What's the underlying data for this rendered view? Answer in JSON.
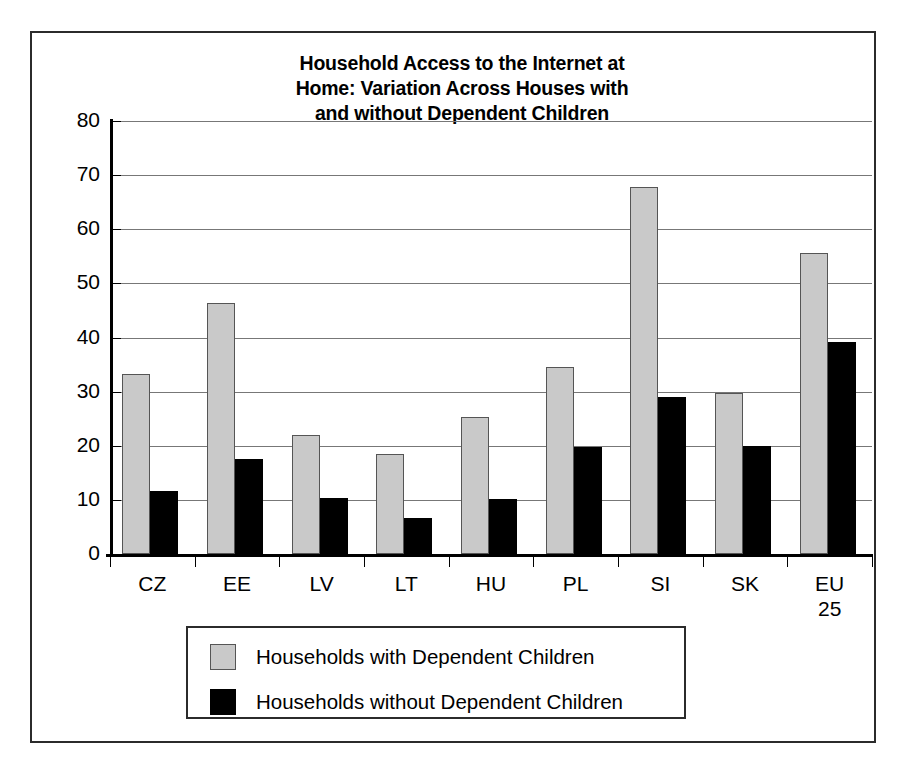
{
  "chart_data": {
    "type": "bar",
    "title": "Household Access to the Internet at Home: Variation Across Houses with and without Dependent Children",
    "title_lines": [
      "Household Access to the Internet at",
      "Home: Variation Across Houses with",
      "and without Dependent Children"
    ],
    "xlabel": "",
    "ylabel": "",
    "ylim": [
      0,
      80
    ],
    "yticks": [
      0,
      10,
      20,
      30,
      40,
      50,
      60,
      70,
      80
    ],
    "ytick_labels": [
      "0",
      "10",
      "20",
      "30",
      "40",
      "50",
      "60",
      "70",
      "80"
    ],
    "grid": true,
    "grid_axis": "y",
    "legend_position": "bottom",
    "categories": [
      "CZ",
      "EE",
      "LV",
      "LT",
      "HU",
      "PL",
      "SI",
      "SK",
      "EU 25"
    ],
    "category_labels": [
      "CZ",
      "EE",
      "LV",
      "LT",
      "HU",
      "PL",
      "SI",
      "SK",
      "EU\n25"
    ],
    "series": [
      {
        "name": "Households with Dependent Children",
        "color": "#c9c9c9",
        "values": [
          33.2,
          46.3,
          22.0,
          18.4,
          25.4,
          34.5,
          67.8,
          29.7,
          55.6
        ]
      },
      {
        "name": "Households without Dependent Children",
        "color": "#000000",
        "values": [
          11.6,
          17.6,
          10.3,
          6.7,
          10.1,
          19.7,
          29.0,
          20.0,
          39.2
        ]
      }
    ]
  },
  "legend": {
    "entries": [
      {
        "label": "Households with Dependent Children",
        "swatch": "gray"
      },
      {
        "label": "Households without Dependent Children",
        "swatch": "black"
      }
    ]
  }
}
